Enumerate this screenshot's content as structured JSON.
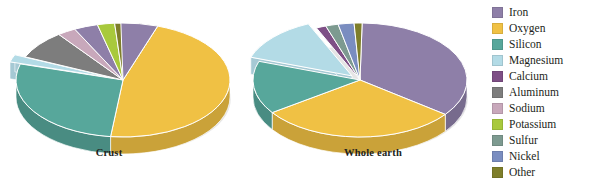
{
  "figure": {
    "background": "#ffffff",
    "text_color": "#231f20"
  },
  "legend": {
    "position": "right",
    "items": [
      {
        "label": "Iron",
        "color": "#8e7fa8"
      },
      {
        "label": "Oxygen",
        "color": "#f0c144"
      },
      {
        "label": "Silicon",
        "color": "#57a79b"
      },
      {
        "label": "Magnesium",
        "color": "#b3dbe6"
      },
      {
        "label": "Calcium",
        "color": "#7e4f86"
      },
      {
        "label": "Aluminum",
        "color": "#7d7d7d"
      },
      {
        "label": "Sodium",
        "color": "#c8a8bb"
      },
      {
        "label": "Potassium",
        "color": "#a8c93c"
      },
      {
        "label": "Sulfur",
        "color": "#7d9a90"
      },
      {
        "label": "Nickel",
        "color": "#7a8dc0"
      },
      {
        "label": "Other",
        "color": "#7e7e2a"
      }
    ]
  },
  "chart_data": [
    {
      "type": "pie",
      "title": "Crust",
      "labels": [
        "Oxygen",
        "Silicon",
        "Magnesium",
        "Aluminum",
        "Sodium",
        "Calcium",
        "Potassium",
        "Other"
      ],
      "values": [
        46.6,
        27.7,
        2.1,
        8.1,
        2.8,
        3.6,
        2.6,
        6.5
      ],
      "colors": [
        "#f0c144",
        "#57a79b",
        "#b3dbe6",
        "#7d7d7d",
        "#c8a8bb",
        "#8e7fa8",
        "#a8c93c",
        "#7e7e2a"
      ],
      "exploded": [
        "Magnesium"
      ],
      "iron_slice": {
        "label": "Iron",
        "value": 5.0,
        "color": "#8e7fa8"
      },
      "legend_position": "right",
      "grid": false
    },
    {
      "type": "pie",
      "title": "Whole earth",
      "labels": [
        "Iron",
        "Oxygen",
        "Silicon",
        "Magnesium",
        "Calcium",
        "Sulfur",
        "Nickel",
        "Other"
      ],
      "values": [
        35.0,
        30.0,
        15.0,
        13.0,
        1.5,
        1.9,
        2.4,
        1.2
      ],
      "colors": [
        "#8e7fa8",
        "#f0c144",
        "#57a79b",
        "#b3dbe6",
        "#7e4f86",
        "#7d9a90",
        "#7a8dc0",
        "#7e7e2a"
      ],
      "exploded": [
        "Magnesium"
      ],
      "legend_position": "right",
      "grid": false
    }
  ]
}
